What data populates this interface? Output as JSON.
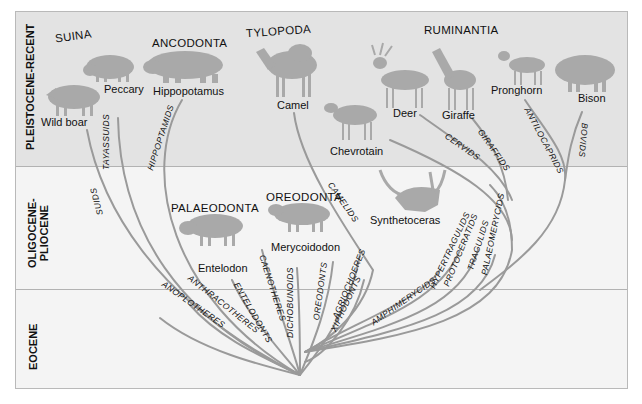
{
  "epochs": [
    {
      "id": "pleistocene-recent",
      "label": "PLEISTOCENE-RECENT"
    },
    {
      "id": "oligocene-pliocene",
      "label": "OLIGOCENE-\nPLIOCENE"
    },
    {
      "id": "eocene",
      "label": "EOCENE"
    }
  ],
  "groups": {
    "suina": "SUINA",
    "ancodonta": "ANCODONTA",
    "tylopoda": "TYLOPODA",
    "ruminantia": "RUMINANTIA",
    "palaeodonta": "PALAEODONTA",
    "oreodonta": "OREODONTA"
  },
  "animals": {
    "wild_boar": "Wild boar",
    "peccary": "Peccary",
    "hippopotamus": "Hippopotamus",
    "camel": "Camel",
    "chevrotain": "Chevrotain",
    "deer": "Deer",
    "giraffe": "Giraffe",
    "pronghorn": "Pronghorn",
    "bison": "Bison",
    "entelodon": "Entelodon",
    "merycoidodon": "Merycoidodon",
    "synthetoceras": "Synthetoceras"
  },
  "families": {
    "suids": "SUIDS",
    "tayassuids": "TAYASSUIDS",
    "hippoptamids": "HIPPOPTAMIDS",
    "camelids": "CAMELIDS",
    "cervids": "CERVIDS",
    "giraffids": "GIRAFFIDS",
    "antilocaprids": "ANTILOCAPRIDS",
    "bovids": "BOVIDS",
    "anoplotheres": "ANOPLOTHERES",
    "anthracotheres": "ANTHRACOTHERES",
    "entelodonts": "ENTELODONTS",
    "caenotheres": "CAENOTHERES",
    "dichobunoids": "DICHOBUNOIDS",
    "oreodonts": "OREODONTS",
    "agriochoeres": "AGRIOCHOERES",
    "xiphodonts": "XIPHODONTS",
    "amphimerycids": "AMPHIMERYCIDS",
    "hypertragulids": "HYPERTRAGULIDS",
    "protoceratids": "PROTOCERATIDS",
    "tragulids": "TRAGULIDS",
    "palaeomerycids": "PALAEOMERYCIDS"
  },
  "colors": {
    "band_top": "#e3e3e3",
    "band_lower": "#f4f4f4",
    "lineage": "#9a9a9a",
    "silhouette": "#a9a9a9"
  }
}
